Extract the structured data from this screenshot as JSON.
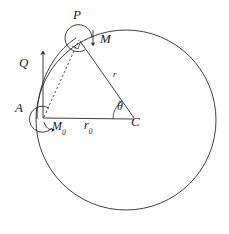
{
  "figure": {
    "stroke_color": "#2a2a2a",
    "background_color": "#fefefe",
    "labels": [
      {
        "id": "P",
        "text": "P",
        "x": 73,
        "y": 14,
        "size": "big",
        "sub": ""
      },
      {
        "id": "M",
        "text": "M",
        "x": 100,
        "y": 38,
        "size": "big",
        "sub": ""
      },
      {
        "id": "Q",
        "text": "Q",
        "x": 20,
        "y": 60,
        "size": "big",
        "sub": ""
      },
      {
        "id": "r",
        "text": "r",
        "x": 113,
        "y": 74,
        "size": "small",
        "sub": ""
      },
      {
        "id": "A",
        "text": "A",
        "x": 16,
        "y": 106,
        "size": "big",
        "sub": ""
      },
      {
        "id": "M0",
        "text": "M",
        "x": 52,
        "y": 124,
        "size": "mid",
        "sub": "0"
      },
      {
        "id": "r0",
        "text": "r",
        "x": 84,
        "y": 124,
        "size": "mid",
        "sub": "0"
      },
      {
        "id": "theta",
        "text": "θ",
        "x": 118,
        "y": 105,
        "size": "mid",
        "sub": ""
      },
      {
        "id": "C",
        "text": "C",
        "x": 132,
        "y": 120,
        "size": "big",
        "sub": ""
      }
    ],
    "geometry": {
      "circle": {
        "cx": 126,
        "cy": 120,
        "r": 90
      },
      "point_A": {
        "x": 43,
        "y": 118
      },
      "point_C": {
        "x": 135,
        "y": 119
      },
      "point_P": {
        "x": 79,
        "y": 39
      },
      "radius_label": "r",
      "chord_label": "r0",
      "angle_label": "θ",
      "force_label": "Q",
      "moment_labels": [
        "M",
        "M0"
      ]
    }
  }
}
